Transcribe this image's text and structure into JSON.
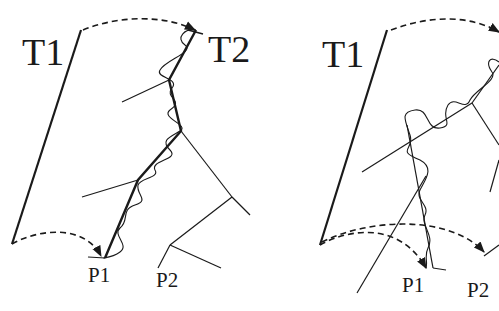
{
  "figure": {
    "left_panel": {
      "tangent_start_label": "T1",
      "tangent_end_label": "T2",
      "point_labels": [
        "P1",
        "P2"
      ]
    },
    "right_panel": {
      "tangent_start_label": "T1",
      "point_labels": [
        "P1",
        "P2"
      ]
    },
    "colors": {
      "ink": "#1a1a1a",
      "background": "#ffffff"
    }
  }
}
